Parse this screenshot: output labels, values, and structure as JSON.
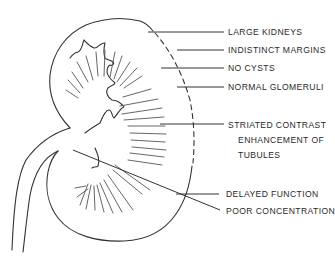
{
  "diagram": {
    "stroke_color": "#333333",
    "labels": [
      {
        "id": "large-kidneys",
        "text": "LARGE KIDNEYS"
      },
      {
        "id": "indistinct-margins",
        "text": "INDISTINCT MARGINS"
      },
      {
        "id": "no-cysts",
        "text": "NO CYSTS"
      },
      {
        "id": "normal-glomeruli",
        "text": "NORMAL GLOMERULI"
      },
      {
        "id": "striated-contrast",
        "text": "STRIATED CONTRAST",
        "line2": "ENHANCEMENT OF",
        "line3": "TUBULES"
      },
      {
        "id": "delayed-function",
        "text": "DELAYED FUNCTION"
      },
      {
        "id": "poor-concentration",
        "text": "POOR CONCENTRATION"
      }
    ]
  }
}
